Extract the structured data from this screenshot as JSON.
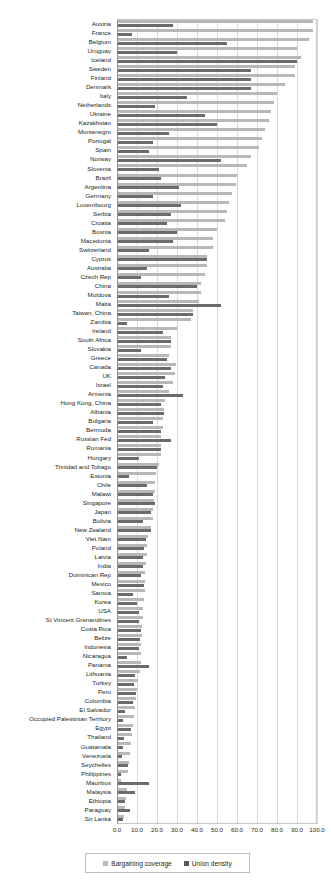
{
  "chart_data": {
    "type": "bar",
    "orientation": "horizontal",
    "title": "",
    "subtitle": "",
    "xlabel": "",
    "ylabel": "",
    "xlim": [
      0,
      100
    ],
    "xticks": [
      "0.0",
      "10.0",
      "20.0",
      "30.0",
      "40.0",
      "50.0",
      "60.0",
      "70.0",
      "80.0",
      "90.0",
      "100.0"
    ],
    "xtick_values": [
      0,
      10,
      20,
      30,
      40,
      50,
      60,
      70,
      80,
      90,
      100
    ],
    "grid": true,
    "legend_position": "bottom",
    "colors": {
      "bargaining_coverage": "#b8b8b8",
      "union_density": "#6b6b6b",
      "gridline": "#d9d9d9",
      "axis": "#8d8d8d",
      "text": "#231f20"
    },
    "series": [
      {
        "name": "Bargaining coverage",
        "key": "coverage"
      },
      {
        "name": "Union density",
        "key": "density"
      }
    ],
    "categories": [
      "Austria",
      "France",
      "Belgium",
      "Uruguay",
      "Iceland",
      "Sweden",
      "Finland",
      "Denmark",
      "Italy",
      "Netherlands",
      "Ukraine",
      "Kazakhstan",
      "Montenegro",
      "Portugal",
      "Spain",
      "Norway",
      "Slovenia",
      "Brazil",
      "Argentina",
      "Germany",
      "Luxembourg",
      "Serbia",
      "Croatia",
      "Bosnia",
      "Macedonia",
      "Switzerland",
      "Cyprus",
      "Australia",
      "Czech Rep",
      "China",
      "Moldova",
      "Malta",
      "Taiwan, China",
      "Zambia",
      "Ireland",
      "South Africa",
      "Slovakia",
      "Greece",
      "Canada",
      "UK",
      "Israel",
      "Armenia",
      "Hong Kong, China",
      "Albania",
      "Bulgaria",
      "Bermuda",
      "Russian Fed",
      "Romania",
      "Hungary",
      "Trinidad and Tobago",
      "Estonia",
      "Chile",
      "Malawi",
      "Singapore",
      "Japan",
      "Bolivia",
      "New Zealand",
      "Viet Nam",
      "Poland",
      "Latvia",
      "India",
      "Dominican Rep",
      "Mexico",
      "Samoa",
      "Korea",
      "USA",
      "St Vincent Grenandines",
      "Costa Rica",
      "Belize",
      "Indonesia",
      "Nicaragua",
      "Panama",
      "Lithuania",
      "Turkey",
      "Peru",
      "Colombia",
      "El Salvador",
      "Occupied Palestinian Territory",
      "Egypt",
      "Thailand",
      "Guatamala",
      "Venezuela",
      "Seychelles",
      "Philippines",
      "Mauritius",
      "Malaysia",
      "Ethiopia",
      "Paraguay",
      "Sri Lanka"
    ],
    "values": {
      "coverage": [
        98.0,
        98.0,
        96.0,
        89.8,
        92.0,
        89.0,
        89.0,
        84.0,
        80.0,
        78.6,
        76.8,
        75.8,
        74.0,
        72.3,
        70.8,
        67.0,
        65.0,
        60.0,
        59.5,
        57.6,
        56.0,
        55.0,
        54.0,
        50.0,
        48.0,
        48.0,
        45.0,
        45.0,
        44.0,
        42.0,
        42.0,
        41.0,
        38.0,
        37.0,
        30.0,
        27.0,
        27.0,
        26.0,
        29.4,
        29.0,
        28.0,
        26.0,
        24.0,
        23.5,
        23.0,
        23.0,
        22.0,
        22.0,
        22.0,
        21.0,
        19.4,
        19.0,
        18.8,
        18.5,
        18.0,
        17.8,
        17.0,
        15.5,
        15.0,
        14.8,
        14.5,
        14.2,
        14.0,
        13.8,
        13.5,
        13.2,
        12.8,
        12.5,
        12.3,
        12.0,
        12.0,
        12.0,
        11.5,
        10.5,
        10.0,
        9.5,
        9.0,
        8.5,
        8.0,
        7.5,
        7.0,
        6.5,
        6.0,
        5.5,
        2.0,
        5.0,
        4.5,
        4.0,
        3.5
      ],
      "density": [
        28.0,
        7.7,
        55.0,
        30.0,
        90.0,
        67.0,
        67.0,
        67.0,
        35.0,
        19.0,
        44.0,
        50.0,
        26.0,
        18.0,
        16.0,
        52.0,
        21.0,
        22.0,
        31.0,
        18.0,
        32.0,
        27.0,
        25.0,
        30.0,
        28.0,
        16.0,
        45.0,
        15.0,
        12.0,
        40.0,
        26.0,
        52.0,
        38.0,
        5.0,
        23.0,
        27.0,
        12.0,
        25.0,
        27.0,
        24.0,
        23.0,
        33.0,
        22.0,
        23.5,
        18.0,
        22.0,
        27.0,
        22.0,
        11.0,
        20.0,
        6.0,
        15.0,
        18.0,
        19.0,
        17.0,
        13.0,
        17.0,
        14.5,
        13.5,
        13.0,
        13.0,
        12.0,
        13.5,
        8.0,
        10.0,
        11.0,
        11.0,
        12.0,
        11.5,
        11.0,
        5.0,
        16.0,
        9.0,
        8.5,
        9.5,
        8.0,
        4.0,
        3.0,
        7.0,
        3.5,
        3.0,
        2.5,
        5.5,
        2.0,
        16.0,
        9.0,
        4.0,
        6.5,
        3.0
      ]
    }
  },
  "legend": {
    "items": [
      {
        "label": "Bargaining coverage",
        "swatch": "cov"
      },
      {
        "label": "Union density",
        "swatch": "den"
      }
    ]
  }
}
